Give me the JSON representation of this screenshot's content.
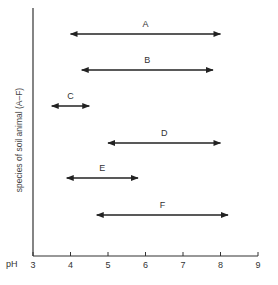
{
  "chart_data": {
    "type": "range",
    "title": "",
    "xlabel": "pH",
    "ylabel": "species of soil animal (A–F)",
    "xlim": [
      3,
      9
    ],
    "xticks": [
      "3",
      "4",
      "5",
      "6",
      "7",
      "8",
      "9"
    ],
    "grid": false,
    "legend": null,
    "categories": [
      "A",
      "B",
      "C",
      "D",
      "E",
      "F"
    ],
    "series": [
      {
        "name": "A",
        "start": 4.0,
        "end": 8.0
      },
      {
        "name": "B",
        "start": 4.3,
        "end": 7.8
      },
      {
        "name": "C",
        "start": 3.5,
        "end": 4.5
      },
      {
        "name": "D",
        "start": 5.0,
        "end": 8.0
      },
      {
        "name": "E",
        "start": 3.9,
        "end": 5.8
      },
      {
        "name": "F",
        "start": 4.7,
        "end": 8.2
      }
    ],
    "colors": {
      "line": "#222222",
      "axis": "#333333"
    }
  }
}
